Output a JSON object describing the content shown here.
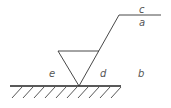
{
  "diagram": {
    "type": "surface-roughness-symbol",
    "labels": {
      "c": "c",
      "a": "a",
      "b": "b",
      "d": "d",
      "e": "e"
    },
    "colors": {
      "line": "#333333",
      "text": "#555555",
      "background": "#ffffff"
    }
  }
}
